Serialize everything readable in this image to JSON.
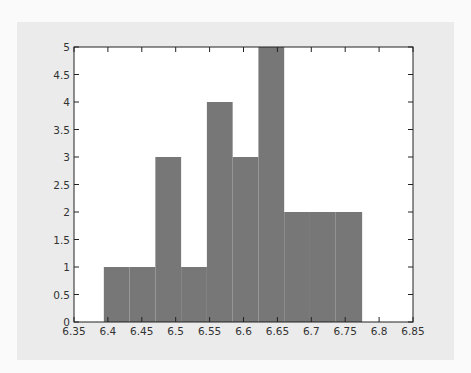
{
  "chart_data": {
    "type": "bar",
    "subtype": "histogram",
    "title": "",
    "xlabel": "",
    "ylabel": "",
    "bin_edges": [
      6.394,
      6.432,
      6.47,
      6.508,
      6.546,
      6.584,
      6.622,
      6.66,
      6.698,
      6.736,
      6.775
    ],
    "values": [
      1,
      1,
      3,
      1,
      4,
      3,
      5,
      2,
      2,
      2
    ],
    "xlim": [
      6.35,
      6.85
    ],
    "ylim": [
      0,
      5
    ],
    "xticks": [
      "6.35",
      "6.4",
      "6.45",
      "6.5",
      "6.55",
      "6.6",
      "6.65",
      "6.7",
      "6.75",
      "6.8",
      "6.85"
    ],
    "yticks": [
      "0",
      "0.5",
      "1",
      "1.5",
      "2",
      "2.5",
      "3",
      "3.5",
      "4",
      "4.5",
      "5"
    ],
    "grid": false,
    "legend": null,
    "bar_color": "#777777",
    "panel_color": "#ebebeb",
    "plot_bg": "#ffffff"
  }
}
